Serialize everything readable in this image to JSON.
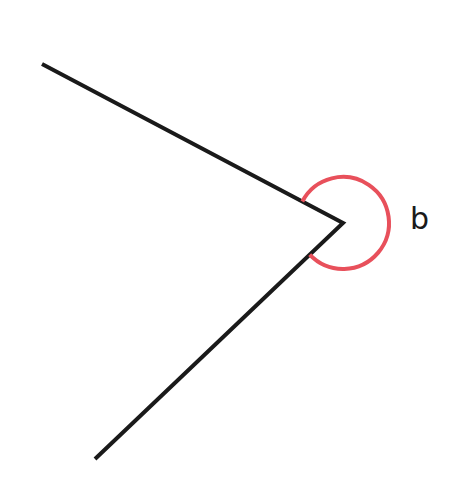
{
  "diagram": {
    "type": "reflex-angle",
    "colors": {
      "line": "#1a1a1a",
      "arc": "#e8505b",
      "background": "#ffffff"
    },
    "vertex": {
      "x": 343,
      "y": 223
    },
    "ray_upper_end": {
      "x": 42,
      "y": 64
    },
    "ray_lower_end": {
      "x": 95,
      "y": 459
    },
    "arc_radius": 46,
    "angle_label": "b"
  }
}
